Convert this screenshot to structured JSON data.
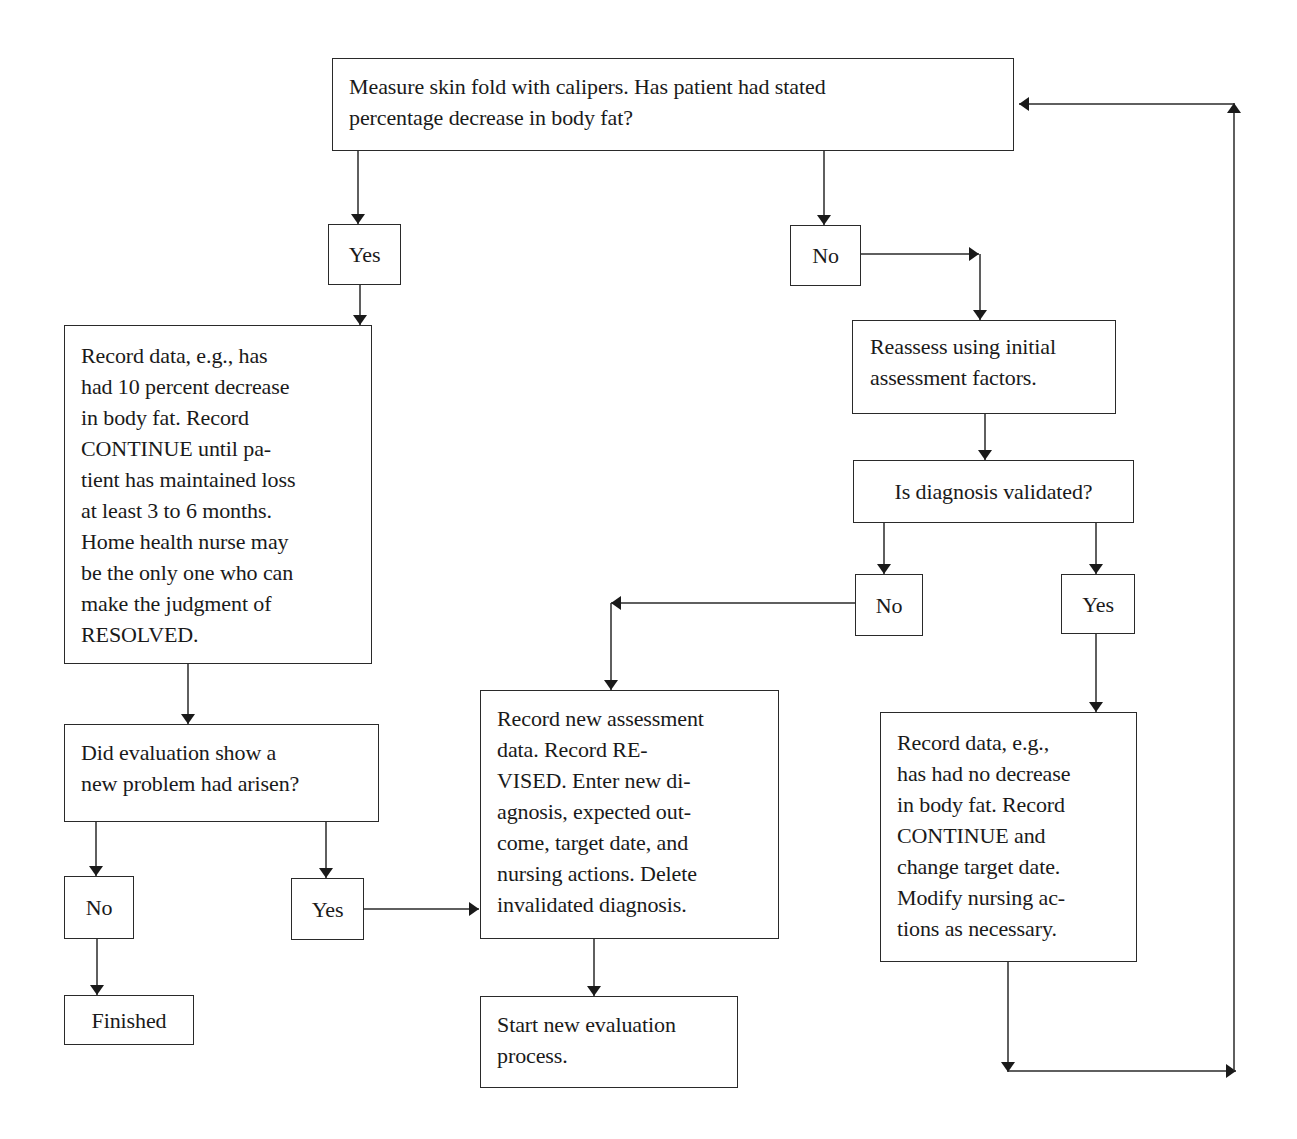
{
  "diagram": {
    "type": "flowchart",
    "nodes": {
      "start": "Measure skin fold with calipers. Has patient had stated\npercentage decrease in body fat?",
      "yes_top": "Yes",
      "no_top": "No",
      "record_resolved": "Record data, e.g., has\nhad 10 percent decrease\nin body fat. Record\nCONTINUE until pa-\ntient has maintained loss\nat least 3 to 6 months.\nHome health nurse may\nbe the only one who can\nmake the judgment of\nRESOLVED.",
      "reassess": "Reassess using initial\nassessment factors.",
      "diagnosis_validated": "Is diagnosis validated?",
      "no_validated": "No",
      "yes_validated": "Yes",
      "new_problem": "Did evaluation show a\nnew problem had arisen?",
      "record_revised": "Record new assessment\ndata. Record RE-\nVISED. Enter new di-\nagnosis, expected out-\ncome, target date, and\nnursing actions. Delete\ninvalidated diagnosis.",
      "record_continue": "Record data, e.g.,\nhas had no decrease\nin body fat. Record\nCONTINUE and\nchange target date.\nModify nursing ac-\ntions as necessary.",
      "no_new_problem": "No",
      "yes_new_problem": "Yes",
      "finished": "Finished",
      "start_new_evaluation": "Start new evaluation\nprocess."
    },
    "edges": [
      {
        "from": "start",
        "to": "yes_top"
      },
      {
        "from": "start",
        "to": "no_top"
      },
      {
        "from": "yes_top",
        "to": "record_resolved"
      },
      {
        "from": "no_top",
        "to": "reassess"
      },
      {
        "from": "reassess",
        "to": "diagnosis_validated"
      },
      {
        "from": "diagnosis_validated",
        "to": "no_validated"
      },
      {
        "from": "diagnosis_validated",
        "to": "yes_validated"
      },
      {
        "from": "no_validated",
        "to": "record_revised"
      },
      {
        "from": "yes_validated",
        "to": "record_continue"
      },
      {
        "from": "record_resolved",
        "to": "new_problem"
      },
      {
        "from": "new_problem",
        "to": "no_new_problem"
      },
      {
        "from": "new_problem",
        "to": "yes_new_problem"
      },
      {
        "from": "no_new_problem",
        "to": "finished"
      },
      {
        "from": "yes_new_problem",
        "to": "record_revised"
      },
      {
        "from": "record_revised",
        "to": "start_new_evaluation"
      },
      {
        "from": "record_continue",
        "to": "start"
      }
    ],
    "colors": {
      "stroke": "#2a2a2a",
      "background": "#ffffff",
      "text": "#1a1a1a"
    }
  }
}
